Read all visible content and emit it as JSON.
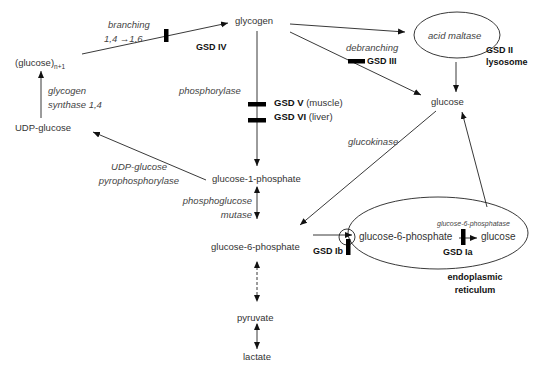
{
  "nodes": {
    "glycogen": "glycogen",
    "glucose_n1": "(glucose)",
    "glucose_n1_sub": "n+1",
    "udp_glucose": "UDP-glucose",
    "glucose_top": "glucose",
    "g1p": "glucose-1-phosphate",
    "g6p": "glucose-6-phosphate",
    "pyruvate": "pyruvate",
    "lactate": "lactate",
    "er_g6p": "glucose-6-phosphate",
    "er_glucose": "glucose"
  },
  "enzymes": {
    "branching_1": "branching",
    "branching_2": "1,4 →1,6",
    "glycogen_synthase_1": "glycogen",
    "glycogen_synthase_2": "synthase 1,4",
    "phosphorylase": "phosphorylase",
    "debranching": "debranching",
    "acid_maltase": "acid maltase",
    "udp_ppase_1": "UDP-glucose",
    "udp_ppase_2": "pyrophosphorylase",
    "glucokinase": "glucokinase",
    "pgm_1": "phosphoglucose",
    "pgm_2": "mutase",
    "g6pase": "glucose-6-phosphatase"
  },
  "diseases": {
    "gsd_iv": "GSD IV",
    "gsd_ii": "GSD II",
    "gsd_iii": "GSD III",
    "gsd_v": "GSD V",
    "gsd_v_note": "(muscle)",
    "gsd_vi": "GSD VI",
    "gsd_vi_note": "(liver)",
    "gsd_ib": "GSD Ib",
    "gsd_ia": "GSD Ia"
  },
  "compartments": {
    "lysosome": "lysosome",
    "er_1": "endoplasmic",
    "er_2": "reticulum"
  },
  "colors": {
    "line": "#222222",
    "block": "#000000",
    "text": "#333333"
  }
}
